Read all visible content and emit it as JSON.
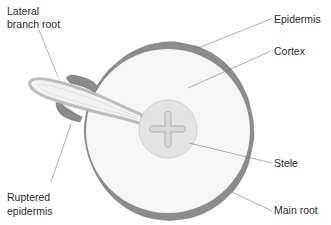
{
  "diagram": {
    "type": "cross-section of plant root showing lateral root emergence",
    "labels": {
      "lateral_line1": "Lateral",
      "lateral_line2": "branch root",
      "epidermis": "Epidermis",
      "cortex": "Cortex",
      "stele": "Stele",
      "main_root": "Main root",
      "ruptered_line1": "Ruptered",
      "ruptered_line2": "epidermis"
    },
    "colors": {
      "epidermis": "#8c8c8c",
      "epidermis_dark": "#6e6e6e",
      "cortex": "#f6f6f6",
      "stele": "#e3e3e3",
      "stele_outline": "#b5b5b5",
      "lateral_root_outline": "#bdbdbd",
      "lateral_root_fill": "#f2f2f2",
      "leader_line": "#7a7a7a",
      "text": "#2a2a2a"
    }
  }
}
